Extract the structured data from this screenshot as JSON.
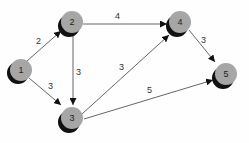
{
  "diagram": {
    "type": "directed-weighted-graph",
    "colors": {
      "node_fill": "#a6a6a6",
      "node_shadow": "#111111",
      "edge": "#555555",
      "background": "#fefefe"
    },
    "nodes": [
      {
        "id": "1",
        "label": "1",
        "x": 20,
        "y": 70
      },
      {
        "id": "2",
        "label": "2",
        "x": 72,
        "y": 22
      },
      {
        "id": "3",
        "label": "3",
        "x": 72,
        "y": 118
      },
      {
        "id": "4",
        "label": "4",
        "x": 180,
        "y": 22
      },
      {
        "id": "5",
        "label": "5",
        "x": 226,
        "y": 74
      }
    ],
    "edges": [
      {
        "from": "1",
        "to": "2",
        "weight": "2"
      },
      {
        "from": "1",
        "to": "3",
        "weight": "3"
      },
      {
        "from": "2",
        "to": "4",
        "weight": "4"
      },
      {
        "from": "2",
        "to": "3",
        "weight": "3"
      },
      {
        "from": "3",
        "to": "4",
        "weight": "3"
      },
      {
        "from": "3",
        "to": "5",
        "weight": "5"
      },
      {
        "from": "4",
        "to": "5",
        "weight": "3"
      }
    ]
  }
}
